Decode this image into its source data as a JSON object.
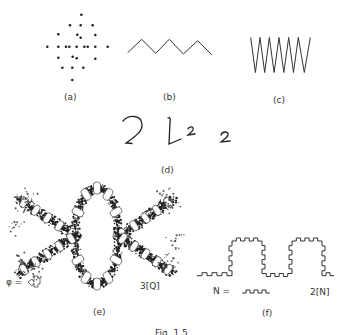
{
  "panels": {
    "a": {
      "label": "(a)",
      "description": "dot pattern"
    },
    "b": {
      "label": "(b)",
      "description": "zigzag line"
    },
    "c": {
      "label": "(c)",
      "description": "dense zigzag"
    },
    "d": {
      "label": "(d)",
      "description": "handwritten twos",
      "glyphs": [
        "2",
        "2",
        "2"
      ]
    },
    "e": {
      "label": "(e)",
      "generator_label": "φ =",
      "iteration_label": "3[Q]"
    },
    "f": {
      "label": "(f)",
      "generator_label": "N =",
      "iteration_label": "2[N]"
    }
  },
  "caption": "Fig. 1.5",
  "colors": {
    "ink": "#222222",
    "background": "#ffffff"
  }
}
